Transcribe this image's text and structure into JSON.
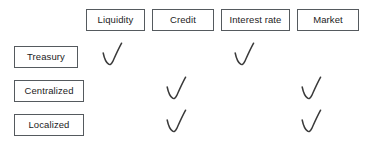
{
  "figure": {
    "kind": "risk-type-matrix",
    "background_color": "#ffffff",
    "box_border_color": "#555a5e",
    "text_color": "#1c1c1c",
    "mark_color": "#3a3a3a",
    "mark_glyph": "checkmark"
  },
  "chart_data": {
    "type": "table",
    "title": "",
    "xlabel": "",
    "ylabel": "",
    "columns": [
      "Liquidity",
      "Credit",
      "Interest rate",
      "Market"
    ],
    "rows": [
      "Treasury",
      "Centralized",
      "Localized"
    ],
    "cells": [
      [
        true,
        false,
        true,
        false
      ],
      [
        false,
        true,
        false,
        true
      ],
      [
        false,
        true,
        false,
        true
      ]
    ],
    "marked_symbol": "checkmark",
    "legend": [],
    "grid": false
  },
  "columns": [
    {
      "label": "Liquidity",
      "x": 86,
      "width": 59
    },
    {
      "label": "Credit",
      "x": 152,
      "width": 62
    },
    {
      "label": "Interest rate",
      "x": 221,
      "width": 69
    },
    {
      "label": "Market",
      "x": 297,
      "width": 62
    }
  ],
  "rows": [
    {
      "label": "Treasury",
      "x": 14,
      "width": 64,
      "y": 46
    },
    {
      "label": "Centralized",
      "x": 14,
      "width": 70,
      "y": 80
    },
    {
      "label": "Localized",
      "x": 14,
      "width": 70,
      "y": 114
    }
  ],
  "marks": [
    {
      "row": "Treasury",
      "column": "Liquidity",
      "x": 100,
      "y": 41
    },
    {
      "row": "Treasury",
      "column": "Interest rate",
      "x": 232,
      "y": 41
    },
    {
      "row": "Centralized",
      "column": "Credit",
      "x": 164,
      "y": 75
    },
    {
      "row": "Centralized",
      "column": "Market",
      "x": 299,
      "y": 75
    },
    {
      "row": "Localized",
      "column": "Credit",
      "x": 164,
      "y": 108
    },
    {
      "row": "Localized",
      "column": "Market",
      "x": 299,
      "y": 108
    }
  ]
}
